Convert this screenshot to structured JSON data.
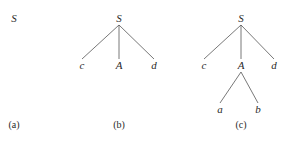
{
  "trees": [
    {
      "caption": "(a)",
      "caption_pos": [
        14,
        128
      ],
      "nodes": [
        {
          "label": "S",
          "x": 14,
          "y": 22
        }
      ],
      "edges": []
    },
    {
      "caption": "(b)",
      "caption_pos": [
        119,
        128
      ],
      "nodes": [
        {
          "label": "S",
          "x": 119,
          "y": 22
        },
        {
          "label": "c",
          "x": 82,
          "y": 69
        },
        {
          "label": "A",
          "x": 119,
          "y": 69
        },
        {
          "label": "d",
          "x": 154,
          "y": 69
        }
      ],
      "edges": [
        [
          0,
          1
        ],
        [
          0,
          2
        ],
        [
          0,
          3
        ]
      ]
    },
    {
      "caption": "(c)",
      "caption_pos": [
        241,
        128
      ],
      "nodes": [
        {
          "label": "S",
          "x": 241,
          "y": 22
        },
        {
          "label": "c",
          "x": 204,
          "y": 69
        },
        {
          "label": "A",
          "x": 241,
          "y": 69
        },
        {
          "label": "d",
          "x": 274,
          "y": 69
        },
        {
          "label": "a",
          "x": 220,
          "y": 113
        },
        {
          "label": "b",
          "x": 258,
          "y": 113
        }
      ],
      "edges": [
        [
          0,
          1
        ],
        [
          0,
          2
        ],
        [
          0,
          3
        ],
        [
          2,
          4
        ],
        [
          2,
          5
        ]
      ]
    }
  ]
}
